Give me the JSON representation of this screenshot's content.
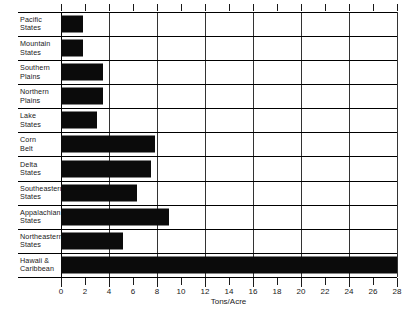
{
  "chart_data": {
    "type": "bar",
    "orientation": "horizontal",
    "title": "",
    "xlabel": "Tons/Acre",
    "ylabel": "",
    "xlim": [
      0,
      28
    ],
    "xticks": [
      0,
      2,
      4,
      6,
      8,
      10,
      12,
      14,
      16,
      18,
      20,
      22,
      24,
      26,
      28
    ],
    "xtick_labels": [
      "0",
      "2",
      "4",
      "6",
      "8",
      "10",
      "12",
      "14",
      "16",
      "18",
      "20",
      "22",
      "24",
      "26",
      "28"
    ],
    "grid": "vertical gridlines at multiples of 4",
    "legend": "none",
    "bar_color": "#0b0b0b",
    "categories": [
      "Pacific States",
      "Mountain States",
      "Southern Plains",
      "Northern Plains",
      "Lake States",
      "Corn Belt",
      "Delta States",
      "Southeastern States",
      "Appalachian States",
      "Northeastern States",
      "Hawaii & Caribbean"
    ],
    "values": [
      1.8,
      1.8,
      3.5,
      3.5,
      3.0,
      7.8,
      7.5,
      6.3,
      9.0,
      5.2,
      28.0
    ],
    "rows": [
      {
        "label_line1": "Pacific",
        "label_line2": "States",
        "value": 1.8
      },
      {
        "label_line1": "Mountain",
        "label_line2": "States",
        "value": 1.8
      },
      {
        "label_line1": "Southern",
        "label_line2": "Plains",
        "value": 3.5
      },
      {
        "label_line1": "Northern",
        "label_line2": "Plains",
        "value": 3.5
      },
      {
        "label_line1": "Lake",
        "label_line2": "States",
        "value": 3.0
      },
      {
        "label_line1": "Corn",
        "label_line2": "Belt",
        "value": 7.8
      },
      {
        "label_line1": "Delta",
        "label_line2": "States",
        "value": 7.5
      },
      {
        "label_line1": "Southeastern",
        "label_line2": "States",
        "value": 6.3
      },
      {
        "label_line1": "Appalachian",
        "label_line2": "States",
        "value": 9.0
      },
      {
        "label_line1": "Northeastern",
        "label_line2": "States",
        "value": 5.2
      },
      {
        "label_line1": "Hawaii &",
        "label_line2": "Caribbean",
        "value": 28.0
      }
    ]
  }
}
